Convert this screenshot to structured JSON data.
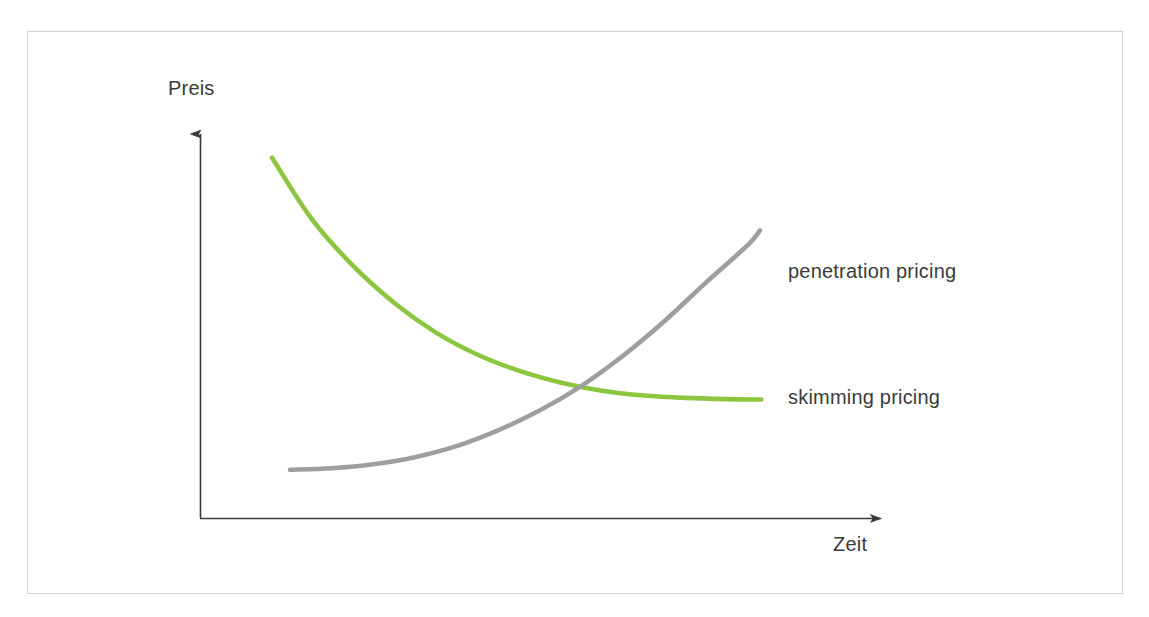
{
  "figure": {
    "background_color": "#ffffff",
    "frame_border_color": "#d2d2d2",
    "axis_color": "#3b3b3b",
    "text_color": "#3b3b3b"
  },
  "axes": {
    "y_axis_label": "Preis",
    "x_axis_label": "Zeit",
    "y_axis_name": "price-axis",
    "x_axis_name": "time-axis"
  },
  "labels": {
    "penetration": "penetration pricing",
    "skimming": "skimming pricing"
  },
  "chart_data": {
    "type": "line",
    "title": "",
    "subtitle": "",
    "xlabel": "Zeit",
    "ylabel": "Preis",
    "xlim": [
      0,
      1
    ],
    "ylim": [
      0,
      1
    ],
    "grid": false,
    "legend_position": "right-inline-labels",
    "annotations": [
      {
        "text": "penetration pricing",
        "x": 0.85,
        "y": 0.71,
        "series": "penetration pricing"
      },
      {
        "text": "skimming pricing",
        "x": 0.85,
        "y": 0.3,
        "series": "skimming pricing"
      }
    ],
    "axis_arrows": {
      "x": true,
      "y": true
    },
    "intersection": {
      "x": 0.62,
      "y": 0.304,
      "note": "curves cross"
    },
    "series": [
      {
        "name": "skimming pricing",
        "color": "#8cc63f",
        "line_width": 4,
        "shape": "decaying exponential",
        "x": [
          0.104,
          0.16,
          0.22,
          0.28,
          0.34,
          0.4,
          0.46,
          0.52,
          0.58,
          0.64,
          0.7,
          0.76,
          0.81
        ],
        "y": [
          0.912,
          0.76,
          0.64,
          0.545,
          0.47,
          0.414,
          0.373,
          0.343,
          0.322,
          0.31,
          0.304,
          0.301,
          0.3
        ]
      },
      {
        "name": "penetration pricing",
        "color": "#9e9e9e",
        "line_width": 4,
        "shape": "growing exponential",
        "x": [
          0.13,
          0.19,
          0.25,
          0.31,
          0.37,
          0.43,
          0.49,
          0.55,
          0.61,
          0.67,
          0.73,
          0.79,
          0.808
        ],
        "y": [
          0.122,
          0.126,
          0.136,
          0.154,
          0.182,
          0.222,
          0.272,
          0.334,
          0.41,
          0.498,
          0.596,
          0.69,
          0.728
        ]
      }
    ]
  }
}
